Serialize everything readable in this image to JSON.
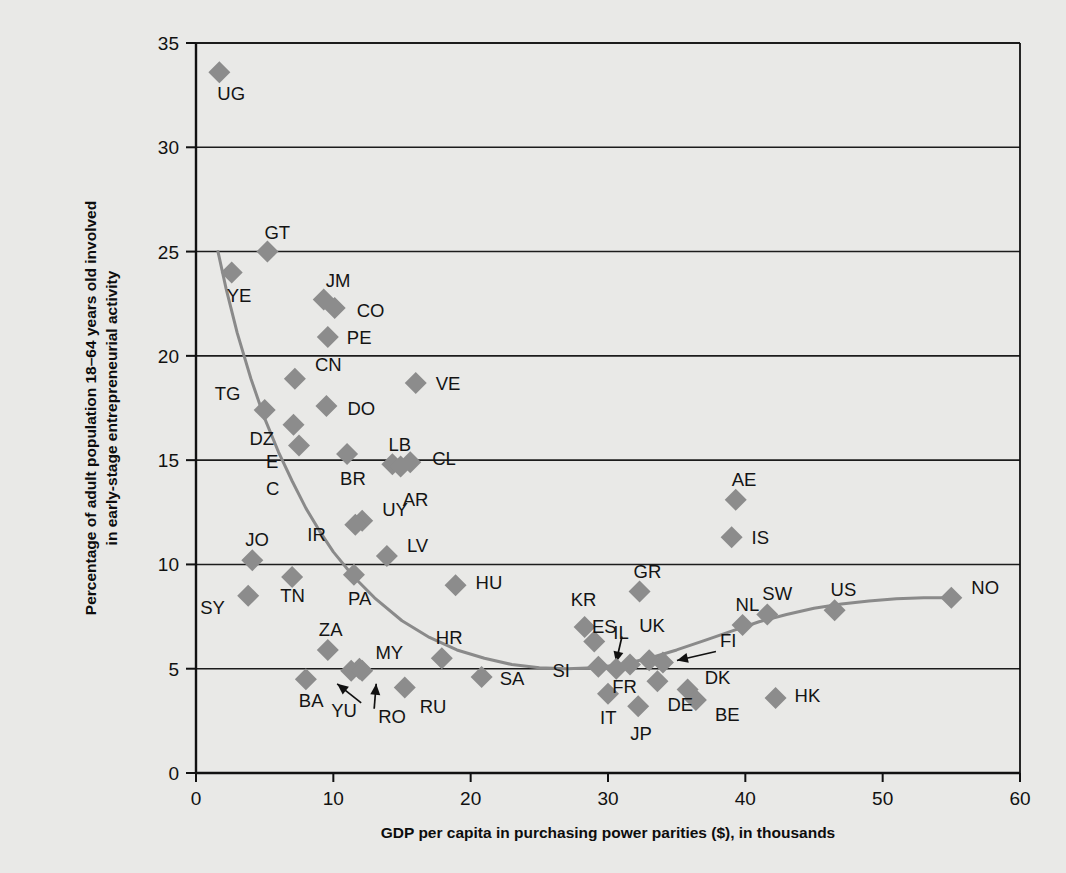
{
  "chart_data": {
    "type": "scatter",
    "title": "",
    "xlabel": "GDP per capita in purchasing power parities ($), in thousands",
    "ylabel": "Percentage of adult population 18–64 years old involved in early-stage entrepreneurial activity",
    "ylabel_line1": "Percentage of adult population 18–64 years old involved",
    "ylabel_line2": "in early-stage entrepreneurial activity",
    "xlim": [
      0,
      60
    ],
    "ylim": [
      0,
      35
    ],
    "xticks": [
      0,
      10,
      20,
      30,
      40,
      50,
      60
    ],
    "yticks": [
      0,
      5,
      10,
      15,
      20,
      25,
      30,
      35
    ],
    "xtick_labels": [
      "0",
      "10",
      "20",
      "30",
      "40",
      "50",
      "60"
    ],
    "ytick_labels": [
      "0",
      "5",
      "10",
      "15",
      "20",
      "25",
      "30",
      "35"
    ],
    "grid": "horizontal",
    "marker": "diamond",
    "marker_color": "#8c8c8c",
    "trend_line": {
      "label": "fitted U-shaped curve",
      "color": "#8a8a8a",
      "points": [
        [
          1.6,
          25.0
        ],
        [
          2.2,
          23.2
        ],
        [
          3.0,
          21.1
        ],
        [
          4.0,
          18.9
        ],
        [
          5.0,
          17.0
        ],
        [
          6.0,
          15.4
        ],
        [
          7.0,
          14.0
        ],
        [
          8.0,
          12.7
        ],
        [
          9.0,
          11.6
        ],
        [
          10.0,
          10.6
        ],
        [
          11.5,
          9.4
        ],
        [
          13.0,
          8.4
        ],
        [
          15.0,
          7.3
        ],
        [
          17.0,
          6.5
        ],
        [
          19.0,
          5.9
        ],
        [
          21.0,
          5.5
        ],
        [
          23.0,
          5.2
        ],
        [
          25.0,
          5.05
        ],
        [
          27.0,
          5.0
        ],
        [
          29.0,
          5.05
        ],
        [
          31.0,
          5.2
        ],
        [
          33.0,
          5.5
        ],
        [
          35.0,
          5.9
        ],
        [
          37.0,
          6.35
        ],
        [
          39.0,
          6.8
        ],
        [
          41.0,
          7.25
        ],
        [
          43.0,
          7.6
        ],
        [
          45.0,
          7.9
        ],
        [
          47.0,
          8.1
        ],
        [
          49.0,
          8.25
        ],
        [
          51.0,
          8.35
        ],
        [
          53.0,
          8.4
        ],
        [
          55.0,
          8.4
        ]
      ]
    },
    "points": [
      {
        "code": "UG",
        "x": 1.7,
        "y": 33.6,
        "label_dx": -2,
        "label_dy": 28
      },
      {
        "code": "GT",
        "x": 5.2,
        "y": 25.0,
        "label_dx": -3,
        "label_dy": -13
      },
      {
        "code": "YE",
        "x": 2.6,
        "y": 24.0,
        "label_dx": -5,
        "label_dy": 30
      },
      {
        "code": "JM",
        "x": 9.3,
        "y": 22.7,
        "label_dx": 2,
        "label_dy": -13
      },
      {
        "code": "CO",
        "x": 10.1,
        "y": 22.3,
        "label_dx": 22,
        "label_dy": 9
      },
      {
        "code": "PE",
        "x": 9.6,
        "y": 20.9,
        "label_dx": 19,
        "label_dy": 7
      },
      {
        "code": "CN",
        "x": 7.2,
        "y": 18.9,
        "label_dx": 20,
        "label_dy": -8
      },
      {
        "code": "VE",
        "x": 16.0,
        "y": 18.7,
        "label_dx": 20,
        "label_dy": 7
      },
      {
        "code": "TG",
        "x": 5.0,
        "y": 17.4,
        "label_dx": -50,
        "label_dy": -10
      },
      {
        "code": "DO",
        "x": 9.5,
        "y": 17.6,
        "label_dx": 21,
        "label_dy": 9
      },
      {
        "code": "DZ",
        "x": 7.1,
        "y": 16.7,
        "label_dx": -44,
        "label_dy": 20
      },
      {
        "code": "EC",
        "x": 7.5,
        "y": 15.7,
        "label_dx": -33,
        "label_dy": 22,
        "stacked": true
      },
      {
        "code": "BR",
        "x": 11.0,
        "y": 15.3,
        "label_dx": -7,
        "label_dy": 31
      },
      {
        "code": "LB",
        "x": 14.3,
        "y": 14.8,
        "label_dx": -4,
        "label_dy": -13
      },
      {
        "code": "AR",
        "x": 14.9,
        "y": 14.7,
        "label_dx": 2,
        "label_dy": 40
      },
      {
        "code": "CL",
        "x": 15.6,
        "y": 14.9,
        "label_dx": 22,
        "label_dy": 3
      },
      {
        "code": "AE",
        "x": 39.3,
        "y": 13.1,
        "label_dx": -4,
        "label_dy": -14
      },
      {
        "code": "UY",
        "x": 12.1,
        "y": 12.1,
        "label_dx": 20,
        "label_dy": -5
      },
      {
        "code": "IR",
        "x": 11.6,
        "y": 11.9,
        "label_dx": -48,
        "label_dy": 16
      },
      {
        "code": "IS",
        "x": 39.0,
        "y": 11.3,
        "label_dx": 20,
        "label_dy": 7
      },
      {
        "code": "LV",
        "x": 13.9,
        "y": 10.4,
        "label_dx": 20,
        "label_dy": -4
      },
      {
        "code": "JO",
        "x": 4.1,
        "y": 10.2,
        "label_dx": -7,
        "label_dy": -14
      },
      {
        "code": "TN",
        "x": 7.0,
        "y": 9.4,
        "label_dx": -12,
        "label_dy": 25
      },
      {
        "code": "PA",
        "x": 11.5,
        "y": 9.5,
        "label_dx": -6,
        "label_dy": 30
      },
      {
        "code": "HU",
        "x": 18.9,
        "y": 9.0,
        "label_dx": 20,
        "label_dy": 4
      },
      {
        "code": "GR",
        "x": 32.3,
        "y": 8.7,
        "label_dx": -6,
        "label_dy": -14
      },
      {
        "code": "SY",
        "x": 3.8,
        "y": 8.5,
        "label_dx": -48,
        "label_dy": 18
      },
      {
        "code": "NO",
        "x": 55.0,
        "y": 8.4,
        "label_dx": 20,
        "label_dy": -4
      },
      {
        "code": "US",
        "x": 46.5,
        "y": 7.8,
        "label_dx": -4,
        "label_dy": -14
      },
      {
        "code": "SW",
        "x": 41.6,
        "y": 7.6,
        "label_dx": -5,
        "label_dy": -14
      },
      {
        "code": "NL",
        "x": 39.8,
        "y": 7.1,
        "label_dx": -7,
        "label_dy": -14
      },
      {
        "code": "KR",
        "x": 28.3,
        "y": 7.0,
        "label_dx": -14,
        "label_dy": -21
      },
      {
        "code": "IL",
        "x": 29.0,
        "y": 6.3,
        "label_dx": 19,
        "label_dy": -3
      },
      {
        "code": "ZA",
        "x": 9.6,
        "y": 5.9,
        "label_dx": -9,
        "label_dy": -14
      },
      {
        "code": "HR",
        "x": 17.9,
        "y": 5.5,
        "label_dx": -6,
        "label_dy": -14
      },
      {
        "code": "SI",
        "x": 29.3,
        "y": 5.1,
        "label_dx": -46,
        "label_dy": 10
      },
      {
        "code": "ES",
        "x": 31.6,
        "y": 5.2,
        "label_dx": -38,
        "label_dy": -32,
        "arrow": [
          -24,
          -22
        ]
      },
      {
        "code": "FR",
        "x": 30.6,
        "y": 5.0,
        "label_dx": -4,
        "label_dy": 24
      },
      {
        "code": "UK",
        "x": 33.0,
        "y": 5.4,
        "label_dx": -10,
        "label_dy": -28
      },
      {
        "code": "FI",
        "x": 34.0,
        "y": 5.3,
        "label_dx": 57,
        "label_dy": -15,
        "arrow": [
          44,
          -10
        ]
      },
      {
        "code": "MY",
        "x": 11.9,
        "y": 5.0,
        "label_dx": 16,
        "label_dy": -10
      },
      {
        "code": "YU",
        "x": 11.3,
        "y": 4.9,
        "label_dx": -20,
        "label_dy": 46,
        "arrow": [
          -10,
          32
        ]
      },
      {
        "code": "RO",
        "x": 12.1,
        "y": 4.9,
        "label_dx": 16,
        "label_dy": 52,
        "arrow": [
          10,
          38
        ]
      },
      {
        "code": "SA",
        "x": 20.8,
        "y": 4.6,
        "label_dx": 18,
        "label_dy": 8
      },
      {
        "code": "BA",
        "x": 8.0,
        "y": 4.5,
        "label_dx": -7,
        "label_dy": 28
      },
      {
        "code": "DE",
        "x": 33.6,
        "y": 4.4,
        "label_dx": 10,
        "label_dy": 30
      },
      {
        "code": "RU",
        "x": 15.2,
        "y": 4.1,
        "label_dx": 15,
        "label_dy": 26
      },
      {
        "code": "DK",
        "x": 35.8,
        "y": 4.0,
        "label_dx": 17,
        "label_dy": -6
      },
      {
        "code": "IT",
        "x": 30.0,
        "y": 3.8,
        "label_dx": -8,
        "label_dy": 30
      },
      {
        "code": "HK",
        "x": 42.2,
        "y": 3.6,
        "label_dx": 19,
        "label_dy": 4
      },
      {
        "code": "BE",
        "x": 36.4,
        "y": 3.5,
        "label_dx": 19,
        "label_dy": 21
      },
      {
        "code": "JP",
        "x": 32.2,
        "y": 3.2,
        "label_dx": -8,
        "label_dy": 34
      }
    ]
  }
}
